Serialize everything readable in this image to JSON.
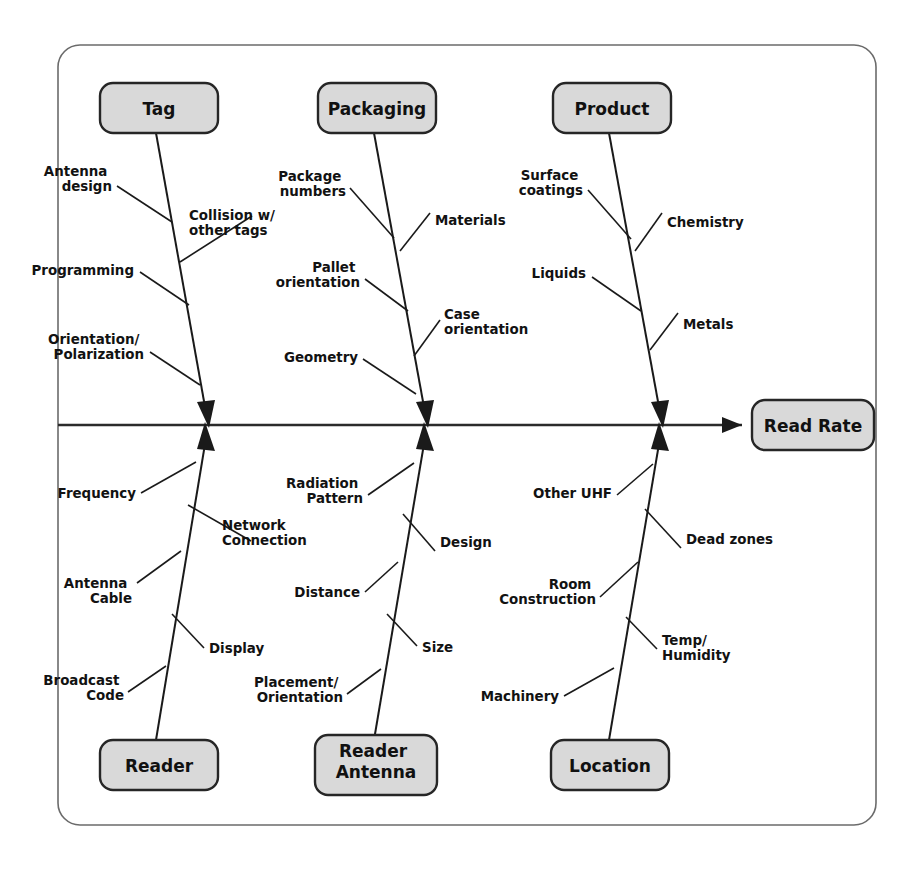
{
  "diagram": {
    "type": "fishbone-ishikawa",
    "effect": {
      "label": "Read Rate"
    },
    "categories": [
      {
        "id": "tag",
        "label": "Tag",
        "position": "top",
        "causes": [
          "Antenna design",
          "Collision w/ other tags",
          "Programming",
          "Orientation/ Polarization"
        ]
      },
      {
        "id": "packaging",
        "label": "Packaging",
        "position": "top",
        "causes": [
          "Package numbers",
          "Materials",
          "Pallet orientation",
          "Case orientation",
          "Geometry"
        ]
      },
      {
        "id": "product",
        "label": "Product",
        "position": "top",
        "causes": [
          "Surface coatings",
          "Chemistry",
          "Liquids",
          "Metals"
        ]
      },
      {
        "id": "reader",
        "label": "Reader",
        "position": "bottom",
        "causes": [
          "Frequency",
          "Network Connection",
          "Antenna Cable",
          "Display",
          "Broadcast Code"
        ]
      },
      {
        "id": "reader-antenna",
        "label": "Reader Antenna",
        "position": "bottom",
        "causes": [
          "Radiation Pattern",
          "Design",
          "Distance",
          "Size",
          "Placement/ Orientation"
        ]
      },
      {
        "id": "location",
        "label": "Location",
        "position": "bottom",
        "causes": [
          "Other UHF",
          "Dead zones",
          "Room Construction",
          "Temp/ Humidity",
          "Machinery"
        ]
      }
    ]
  },
  "boxes": {
    "tag": "Tag",
    "packaging": "Packaging",
    "product": "Product",
    "reader": "Reader",
    "reader_antenna_line1": "Reader",
    "reader_antenna_line2": "Antenna",
    "location": "Location",
    "read_rate": "Read Rate"
  },
  "causes": {
    "tag": {
      "antenna_design_l1": "Antenna",
      "antenna_design_l2": "design",
      "collision_l1": "Collision w/",
      "collision_l2": "other tags",
      "programming": "Programming",
      "orientation_l1": "Orientation/",
      "orientation_l2": "Polarization"
    },
    "packaging": {
      "package_numbers_l1": "Package",
      "package_numbers_l2": "numbers",
      "materials": "Materials",
      "pallet_l1": "Pallet",
      "pallet_l2": "orientation",
      "case_l1": "Case",
      "case_l2": "orientation",
      "geometry": "Geometry"
    },
    "product": {
      "surface_l1": "Surface",
      "surface_l2": "coatings",
      "chemistry": "Chemistry",
      "liquids": "Liquids",
      "metals": "Metals"
    },
    "reader": {
      "frequency": "Frequency",
      "network_l1": "Network",
      "network_l2": "Connection",
      "antenna_cable_l1": "Antenna",
      "antenna_cable_l2": "Cable",
      "display": "Display",
      "broadcast_l1": "Broadcast",
      "broadcast_l2": "Code"
    },
    "reader_antenna": {
      "radiation_l1": "Radiation",
      "radiation_l2": "Pattern",
      "design": "Design",
      "distance": "Distance",
      "size": "Size",
      "placement_l1": "Placement/",
      "placement_l2": "Orientation"
    },
    "location": {
      "other_uhf": "Other UHF",
      "dead_zones": "Dead zones",
      "room_l1": "Room",
      "room_l2": "Construction",
      "temp_l1": "Temp/",
      "temp_l2": "Humidity",
      "machinery": "Machinery"
    }
  },
  "colors": {
    "box_fill": "#d9d9d9",
    "box_stroke": "#262626",
    "line": "#1a1a1a",
    "frame": "#6b6b6b",
    "text": "#111111",
    "background": "#ffffff"
  }
}
